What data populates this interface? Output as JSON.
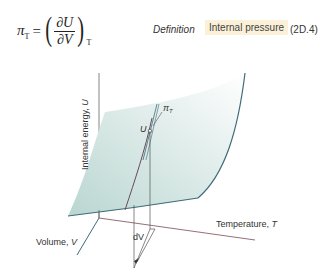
{
  "equation": {
    "lhs_symbol": "π",
    "lhs_subscript": "T",
    "equals": "=",
    "numerator": "∂U",
    "denominator": "∂V",
    "outer_subscript": "T",
    "open_paren": "(",
    "close_paren": ")"
  },
  "definition_label": "Definition",
  "tag_label": "Internal pressure",
  "equation_number": "(2D.4)",
  "colors": {
    "tag_background": "#fbf1d8",
    "surface_fill": "#cfe3df",
    "surface_edge": "#3d6b7a",
    "axis": "#555555",
    "temperature_axis": "#7a4a55"
  },
  "diagram": {
    "axis_u_label": "Internal energy, ",
    "axis_u_symbol": "U",
    "axis_t_label": "Temperature, ",
    "axis_t_symbol": "T",
    "axis_v_label": "Volume, ",
    "axis_v_symbol": "V",
    "point_label": "U",
    "slope_label": "π",
    "slope_subscript": "T",
    "dv_label": "dV"
  }
}
